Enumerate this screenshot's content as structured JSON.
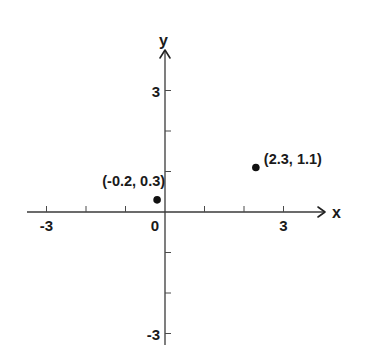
{
  "chart_data": {
    "type": "scatter",
    "title": "",
    "xlabel": "x",
    "ylabel": "y",
    "xlim": [
      -3.5,
      4
    ],
    "ylim": [
      -3.3,
      4
    ],
    "grid": false,
    "legend": null,
    "x_ticks": [
      -3,
      -2,
      -1,
      0,
      1,
      2,
      3
    ],
    "y_ticks": [
      -3,
      -2,
      -1,
      1,
      2,
      3
    ],
    "x_tick_labels": [
      {
        "value": -3,
        "label": "-3"
      },
      {
        "value": 0,
        "label": "0"
      },
      {
        "value": 3,
        "label": "3"
      }
    ],
    "y_tick_labels": [
      {
        "value": 3,
        "label": "3"
      },
      {
        "value": -3,
        "label": "-3"
      }
    ],
    "series": [
      {
        "name": "points",
        "points": [
          {
            "x": -0.2,
            "y": 0.3,
            "label": "(-0.2, 0.3)"
          },
          {
            "x": 2.3,
            "y": 1.1,
            "label": "(2.3, 1.1)"
          }
        ]
      }
    ]
  },
  "axes": {
    "x_name": "x",
    "y_name": "y"
  },
  "colors": {
    "axis": "#3a3a3a",
    "point": "#111111",
    "text": "#1a1a1a",
    "background": "#ffffff"
  }
}
